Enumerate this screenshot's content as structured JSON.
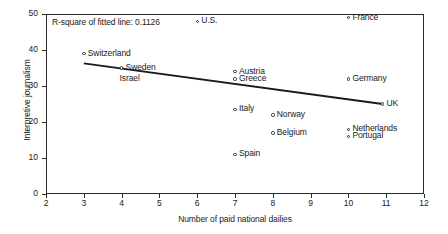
{
  "chart_data": {
    "type": "scatter",
    "title": "",
    "xlabel": "Number of paid national dailies",
    "ylabel": "Interpretive journalism",
    "xlim": [
      2,
      12
    ],
    "ylim": [
      0,
      50
    ],
    "xticks": [
      2,
      3,
      4,
      5,
      6,
      7,
      8,
      9,
      10,
      11,
      12
    ],
    "yticks": [
      0,
      10,
      20,
      30,
      40,
      50
    ],
    "grid": false,
    "legend": false,
    "annotation": "R-square of fitted line: 0.1126",
    "r_square": 0.1126,
    "points": [
      {
        "label": "U.S.",
        "x": 6,
        "y": 48,
        "label_pos": "right"
      },
      {
        "label": "France",
        "x": 10,
        "y": 49,
        "label_pos": "right"
      },
      {
        "label": "Switzerland",
        "x": 3,
        "y": 39,
        "label_pos": "right"
      },
      {
        "label": "Sweden",
        "x": 4,
        "y": 35,
        "label_pos": "right"
      },
      {
        "label": "Israel",
        "x": 4,
        "y": 35,
        "label_pos": "below"
      },
      {
        "label": "Austria",
        "x": 7,
        "y": 34,
        "label_pos": "right"
      },
      {
        "label": "Greece",
        "x": 7,
        "y": 32,
        "label_pos": "right"
      },
      {
        "label": "Germany",
        "x": 10,
        "y": 32,
        "label_pos": "right"
      },
      {
        "label": "Italy",
        "x": 7,
        "y": 23.5,
        "label_pos": "right"
      },
      {
        "label": "UK",
        "x": 10.9,
        "y": 25,
        "label_pos": "right"
      },
      {
        "label": "Norway",
        "x": 8,
        "y": 22,
        "label_pos": "right"
      },
      {
        "label": "Netherlands",
        "x": 10,
        "y": 18,
        "label_pos": "right"
      },
      {
        "label": "Belgium",
        "x": 8,
        "y": 17,
        "label_pos": "right"
      },
      {
        "label": "Portugal",
        "x": 10,
        "y": 16,
        "label_pos": "right"
      },
      {
        "label": "Spain",
        "x": 7,
        "y": 11,
        "label_pos": "right"
      }
    ],
    "fit_line": {
      "x_start": 3,
      "y_start": 36.3,
      "x_end": 10.9,
      "y_end": 25.0
    }
  }
}
